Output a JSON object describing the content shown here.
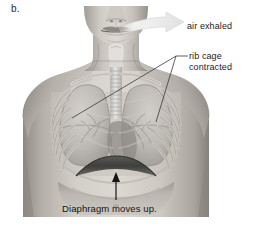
{
  "figure": {
    "letter": "b.",
    "style": "grayscale-anatomical-illustration"
  },
  "labels": {
    "air_exhaled": "air exhaled",
    "rib_cage_line1": "rib cage",
    "rib_cage_line2": "contracted",
    "diaphragm": "Diaphragm moves up."
  },
  "annotations": [
    {
      "name": "air-exhaled-arrow",
      "kind": "curved-sweep-arrow",
      "color": "#e8e8e8",
      "direction": "mouth-to-right"
    },
    {
      "name": "rib-cage-leader-lines",
      "kind": "branching-leader",
      "color": "#3a3a3a",
      "branches": 2
    },
    {
      "name": "diaphragm-arrow",
      "kind": "straight-arrow",
      "color": "#1a1a1a",
      "direction": "up"
    }
  ],
  "colors": {
    "background": "#ffffff",
    "text": "#1c1c1c",
    "skin_light": "#d8d4ce",
    "skin_mid": "#b5b0a9",
    "skin_dark": "#8e8a84",
    "lung_light": "#c9c6c1",
    "lung_mid": "#a8a5a0",
    "rib_bone": "#cfcbc4",
    "diaphragm_dark": "#4a4a48",
    "trachea": "#e2e0dc",
    "leader_line": "#3a3a3a",
    "exhale_arrow": "#ededed"
  },
  "anatomy_parts": [
    "head-lower-face",
    "nose",
    "lips",
    "chin",
    "neck",
    "larynx",
    "trachea",
    "clavicles",
    "shoulders",
    "rib-cage",
    "left-lung",
    "right-lung",
    "bronchi",
    "heart-shadow",
    "diaphragm-raised",
    "abdomen"
  ]
}
